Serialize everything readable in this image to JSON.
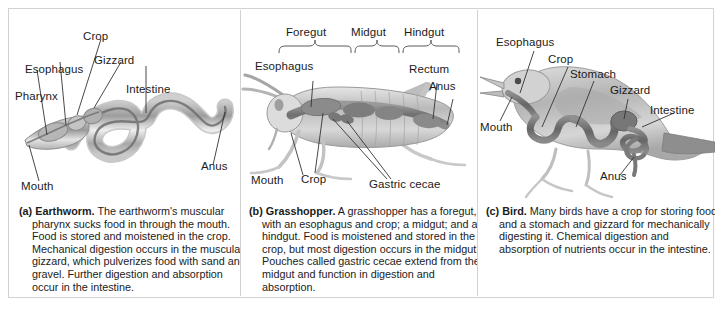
{
  "figure": {
    "border_color": "#d2d2d2",
    "background": "#ffffff",
    "text_color": "#1b1b1b"
  },
  "panels": [
    {
      "id": "earthworm",
      "organism": "Earthworm",
      "labels": [
        {
          "name": "pharynx",
          "text": "Pharynx"
        },
        {
          "name": "esophagus",
          "text": "Esophagus"
        },
        {
          "name": "crop",
          "text": "Crop"
        },
        {
          "name": "gizzard",
          "text": "Gizzard"
        },
        {
          "name": "intestine",
          "text": "Intestine"
        },
        {
          "name": "anus",
          "text": "Anus"
        },
        {
          "name": "mouth",
          "text": "Mouth"
        }
      ],
      "caption": {
        "tag": "(a)",
        "term": "Earthworm.",
        "body": "The earthworm's muscular pharynx sucks food in through the mouth. Food is stored and moistened in the crop. Mechanical digestion occurs in the muscular gizzard, which pulverizes food with sand and gravel. Further digestion and absorption occur in the intestine."
      }
    },
    {
      "id": "grasshopper",
      "organism": "Grasshopper",
      "brackets": [
        {
          "name": "foregut",
          "text": "Foregut"
        },
        {
          "name": "midgut",
          "text": "Midgut"
        },
        {
          "name": "hindgut",
          "text": "Hindgut"
        }
      ],
      "labels": [
        {
          "name": "esophagus",
          "text": "Esophagus"
        },
        {
          "name": "rectum",
          "text": "Rectum"
        },
        {
          "name": "anus",
          "text": "Anus"
        },
        {
          "name": "mouth",
          "text": "Mouth"
        },
        {
          "name": "crop",
          "text": "Crop"
        },
        {
          "name": "gastric-cecae",
          "text": "Gastric cecae"
        }
      ],
      "caption": {
        "tag": "(b)",
        "term": "Grasshopper.",
        "body": "A grasshopper has a foregut, with an esophagus and crop; a midgut; and a hindgut. Food is moistened and stored in the crop, but most digestion occurs in the midgut. Pouches called gastric cecae extend from the midgut and function in digestion and absorption."
      }
    },
    {
      "id": "bird",
      "organism": "Bird",
      "labels": [
        {
          "name": "esophagus",
          "text": "Esophagus"
        },
        {
          "name": "crop",
          "text": "Crop"
        },
        {
          "name": "stomach",
          "text": "Stomach"
        },
        {
          "name": "gizzard",
          "text": "Gizzard"
        },
        {
          "name": "intestine",
          "text": "Intestine"
        },
        {
          "name": "mouth",
          "text": "Mouth"
        },
        {
          "name": "anus",
          "text": "Anus"
        }
      ],
      "caption": {
        "tag": "(c)",
        "term": "Bird.",
        "body": "Many birds have a crop for storing food and a stomach and gizzard for mechanically digesting it. Chemical digestion and absorption of nutrients occur in the intestine."
      }
    }
  ]
}
